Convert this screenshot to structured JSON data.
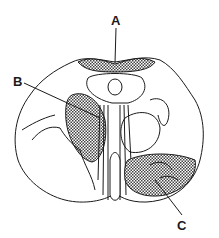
{
  "diagram": {
    "type": "anatomical cross-section line drawing",
    "labels": [
      {
        "id": "A",
        "text": "A",
        "points_to": "hatched dorsal region along top edge"
      },
      {
        "id": "B",
        "text": "B",
        "points_to": "hatched oval region left of midline"
      },
      {
        "id": "C",
        "text": "C",
        "points_to": "hatched region lower right"
      }
    ],
    "colors": {
      "line": "#1a1a1a",
      "background": "#ffffff",
      "hatch": "#555555"
    }
  }
}
